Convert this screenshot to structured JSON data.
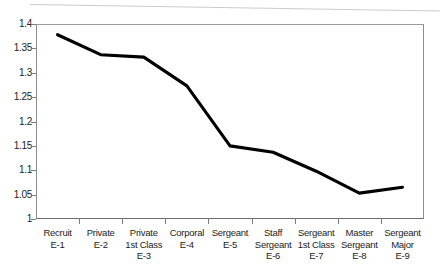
{
  "chart_data": {
    "type": "line",
    "title": "",
    "subtitle": "",
    "xlabel": "",
    "ylabel": "",
    "ylim": [
      1,
      1.4
    ],
    "ytick_step": 0.05,
    "grid": false,
    "legend": false,
    "legend_position": "none",
    "line_color": "#000000",
    "categories": [
      "Recruit\nE-1",
      "Private\nE-2",
      "Private\n1st Class\nE-3",
      "Corporal\nE-4",
      "Sergeant\nE-5",
      "Staff\nSergeant\nE-6",
      "Sergeant\n1st Class\nE-7",
      "Master\nSergeant\nE-8",
      "Sergeant\nMajor\nE-9"
    ],
    "category_lines": [
      [
        "Recruit",
        "E-1"
      ],
      [
        "Private",
        "E-2"
      ],
      [
        "Private",
        "1st Class",
        "E-3"
      ],
      [
        "Corporal",
        "E-4"
      ],
      [
        "Sergeant",
        "E-5"
      ],
      [
        "Staff",
        "Sergeant",
        "E-6"
      ],
      [
        "Sergeant",
        "1st Class",
        "E-7"
      ],
      [
        "Master",
        "Sergeant",
        "E-8"
      ],
      [
        "Sergeant",
        "Major",
        "E-9"
      ]
    ],
    "values": [
      1.378,
      1.337,
      1.332,
      1.273,
      1.15,
      1.137,
      1.098,
      1.053,
      1.065
    ],
    "ytick_labels": [
      "1.4",
      "1.35",
      "1.3",
      "1.25",
      "1.2",
      "1.15",
      "1.1",
      "1.05",
      "1"
    ],
    "ytick_values": [
      1.4,
      1.35,
      1.3,
      1.25,
      1.2,
      1.15,
      1.1,
      1.05,
      1
    ]
  }
}
